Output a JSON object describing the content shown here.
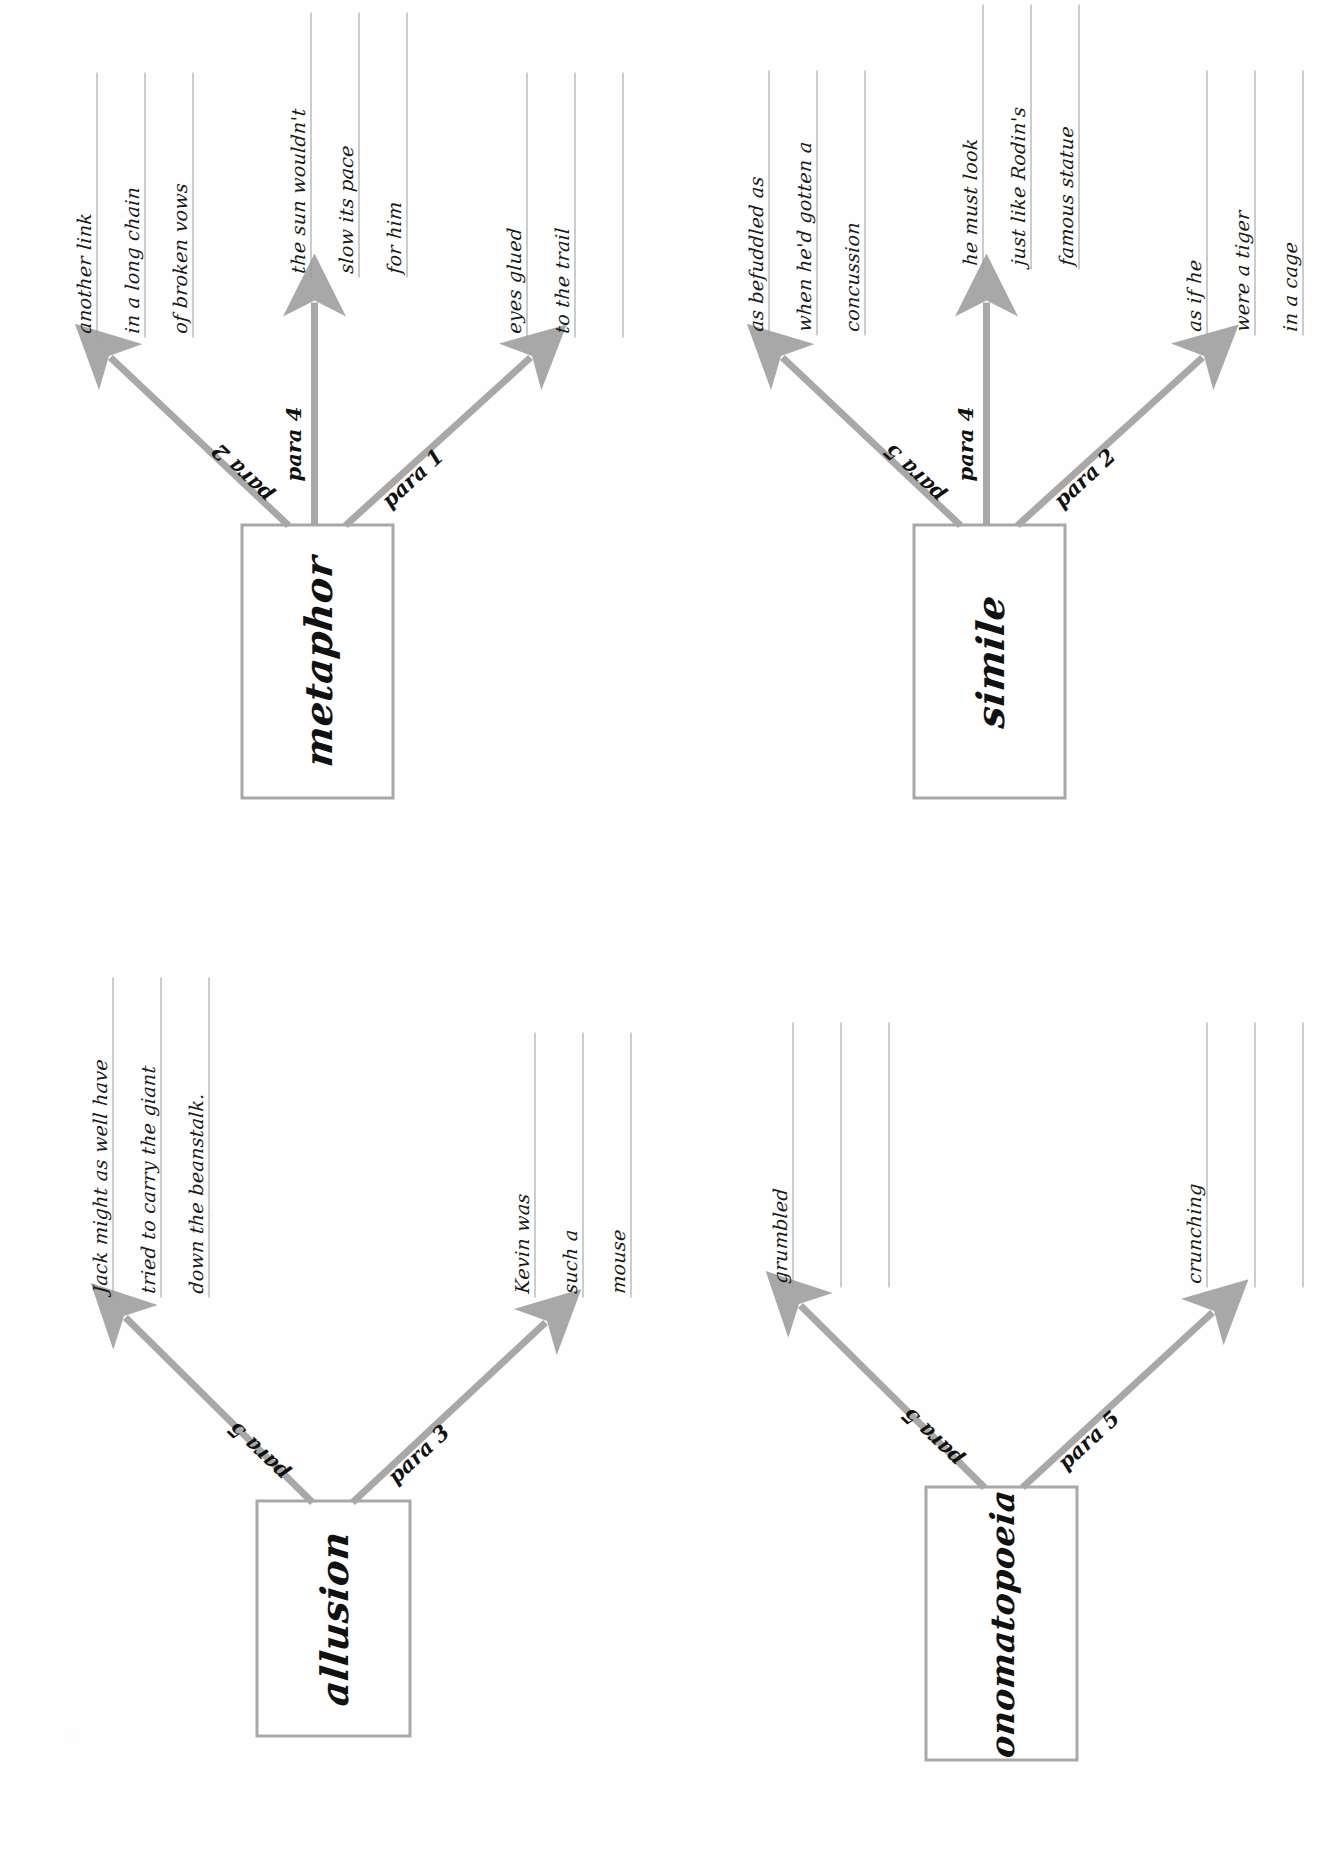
{
  "worksheet": {
    "orientation": "rotated-90-counterclockwise",
    "background_color": "#ffffff",
    "ink_color": "#1a1a1a",
    "box_border_color": "#a8a8a8",
    "arrow_color": "#a8a8a8",
    "rule_line_color": "#9a9a9a"
  },
  "maps": [
    {
      "id": "allusion",
      "title": "allusion",
      "branches": [
        {
          "id": "allusion-para-3",
          "label": "para 3",
          "direction": "down",
          "lines": [
            "Kevin was",
            "such a",
            "mouse"
          ]
        },
        {
          "id": "allusion-para-5",
          "label": "para 5",
          "direction": "up",
          "lines": [
            "Jack might as well have",
            "tried to carry the giant",
            "down the beanstalk."
          ]
        }
      ]
    },
    {
      "id": "metaphor",
      "title": "metaphor",
      "branches": [
        {
          "id": "metaphor-para-1",
          "label": "para 1",
          "direction": "down",
          "lines": [
            "eyes glued",
            "to the trail",
            ""
          ]
        },
        {
          "id": "metaphor-para-4",
          "label": "para 4",
          "direction": "right",
          "lines": [
            "the sun wouldn't",
            "slow its pace",
            "for him"
          ]
        },
        {
          "id": "metaphor-para-2",
          "label": "para 2",
          "direction": "up",
          "lines": [
            "another link",
            "in a long chain",
            "of broken vows"
          ]
        }
      ]
    },
    {
      "id": "simile",
      "title": "simile",
      "branches": [
        {
          "id": "simile-para-2",
          "label": "para 2",
          "direction": "down",
          "lines": [
            "as if he",
            "were a tiger",
            "in a cage"
          ]
        },
        {
          "id": "simile-para-4",
          "label": "para 4",
          "direction": "right",
          "lines": [
            "he must look",
            "just like Rodin's",
            "famous statue"
          ]
        },
        {
          "id": "simile-para-5",
          "label": "para 5",
          "direction": "up",
          "lines": [
            "as befuddled as",
            "when he'd gotten a",
            "concussion"
          ]
        }
      ]
    },
    {
      "id": "onomatopoeia",
      "title": "onomatopoeia",
      "branches": [
        {
          "id": "onomatopoeia-para-5-lower",
          "label": "para 5",
          "direction": "down",
          "lines": [
            "crunching",
            "",
            ""
          ]
        },
        {
          "id": "onomatopoeia-para-5-upper",
          "label": "para 5",
          "direction": "up",
          "lines": [
            "grumbled",
            "",
            ""
          ]
        }
      ]
    }
  ]
}
